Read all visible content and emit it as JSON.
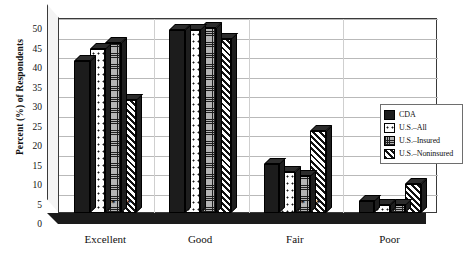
{
  "chart_data": {
    "type": "bar",
    "title": "",
    "xlabel": "",
    "ylabel": "Percent (%) of Respondents",
    "ylim": [
      0,
      50
    ],
    "ytick_step": 5,
    "yticks": [
      0,
      5,
      10,
      15,
      20,
      25,
      30,
      35,
      40,
      45,
      50
    ],
    "grid": true,
    "legend_position": "right",
    "categories": [
      "Excellent",
      "Good",
      "Fair",
      "Poor"
    ],
    "series": [
      {
        "name": "CDA",
        "fill": "solid-black",
        "values": [
          39,
          47,
          12.5,
          3
        ]
      },
      {
        "name": "U.S.–All",
        "fill": "white-dotted",
        "values": [
          42,
          47,
          10.5,
          2
        ]
      },
      {
        "name": "U.S.–Insured",
        "fill": "gray-grid",
        "values": [
          43.5,
          47.5,
          9.5,
          2
        ]
      },
      {
        "name": "U.S.–Noninsured",
        "fill": "diagonal-hatch",
        "values": [
          29,
          44.5,
          21,
          7.5
        ]
      }
    ],
    "annotations": [
      {
        "text": "*",
        "category": "Excellent",
        "series": "U.S.–Insured"
      },
      {
        "text": "*",
        "category": "Excellent",
        "series": "U.S.–Noninsured"
      },
      {
        "text": "*",
        "category": "Fair",
        "series": "U.S.–Insured"
      },
      {
        "text": "*",
        "category": "Fair",
        "series": "U.S.–Noninsured"
      }
    ]
  },
  "legend": {
    "items": [
      {
        "label": "CDA"
      },
      {
        "label": "U.S.–All"
      },
      {
        "label": "U.S.–Insured"
      },
      {
        "label": "U.S.–Noninsured"
      }
    ]
  },
  "colors": {
    "axis": "#333333",
    "grid": "#b9b9b9",
    "bar_dark": "#1c1c1c",
    "bar_gray": "#b4b4b4",
    "background": "#ffffff"
  }
}
